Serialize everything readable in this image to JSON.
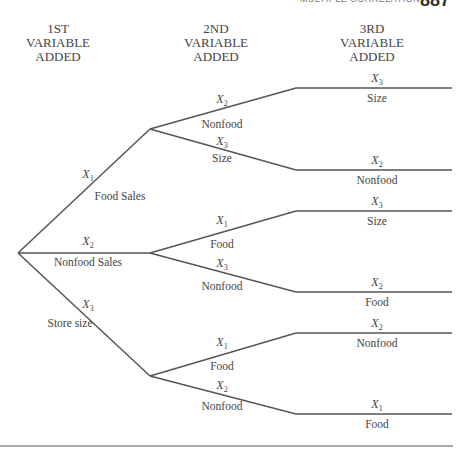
{
  "running_head": {
    "text": "MULTIPLE CORRELATION",
    "page_number": "887"
  },
  "column_headers": [
    {
      "lines": [
        "1ST",
        "VARIABLE",
        "ADDED"
      ]
    },
    {
      "lines": [
        "2ND",
        "VARIABLE",
        "ADDED"
      ]
    },
    {
      "lines": [
        "3RD",
        "VARIABLE",
        "ADDED"
      ]
    }
  ],
  "colors": {
    "line": "#555555",
    "text": "#444444",
    "background": "#ffffff"
  },
  "tree": {
    "root": {
      "x": 18,
      "y": 253
    },
    "first_level": [
      {
        "var": "X",
        "sub": "1",
        "label": "Food Sales",
        "node": {
          "x": 150,
          "y": 129
        },
        "children": [
          {
            "var": "X",
            "sub": "2",
            "label": "Nonfood",
            "leaf_y": 88,
            "third": {
              "var": "X",
              "sub": "3",
              "label": "Size"
            }
          },
          {
            "var": "X",
            "sub": "3",
            "label": "Size",
            "leaf_y": 170,
            "third": {
              "var": "X",
              "sub": "2",
              "label": "Nonfood"
            }
          }
        ]
      },
      {
        "var": "X",
        "sub": "2",
        "label": "Nonfood Sales",
        "node": {
          "x": 150,
          "y": 253
        },
        "children": [
          {
            "var": "X",
            "sub": "1",
            "label": "Food",
            "leaf_y": 211,
            "third": {
              "var": "X",
              "sub": "3",
              "label": "Size"
            }
          },
          {
            "var": "X",
            "sub": "3",
            "label": "Nonfood",
            "leaf_y": 292,
            "third": {
              "var": "X",
              "sub": "2",
              "label": "Food"
            }
          }
        ]
      },
      {
        "var": "X",
        "sub": "3",
        "label": "Store size",
        "node": {
          "x": 150,
          "y": 376
        },
        "children": [
          {
            "var": "X",
            "sub": "1",
            "label": "Food",
            "leaf_y": 333,
            "third": {
              "var": "X",
              "sub": "2",
              "label": "Nonfood"
            }
          },
          {
            "var": "X",
            "sub": "2",
            "label": "Nonfood",
            "leaf_y": 414,
            "third": {
              "var": "X",
              "sub": "1",
              "label": "Food"
            }
          }
        ]
      }
    ]
  }
}
